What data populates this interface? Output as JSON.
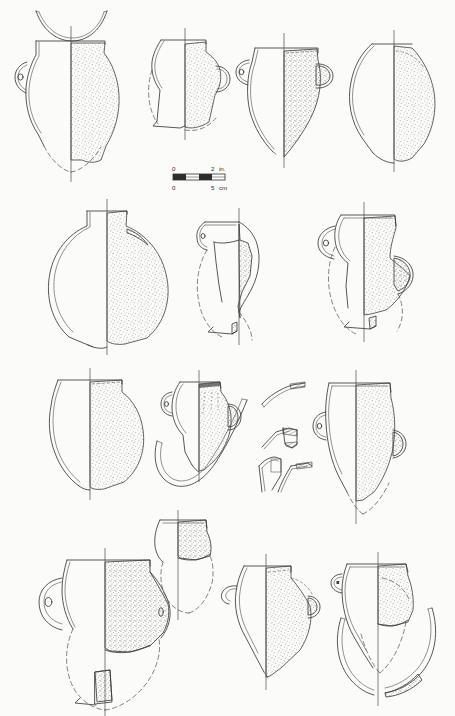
{
  "plate": {
    "title": "Ceramic vessel profile plate",
    "description": "Archaeological illustration plate of fourteen reconstructed ceramic vessel profiles with loose rim and handle sherds and a dual-unit scale bar.",
    "background_color": "#fbfbfa",
    "ink_color": "#3a3a3a",
    "stipple_color": "#6e6e6e",
    "rows": 4
  },
  "scale_bar": {
    "name": "scale-bar",
    "imperial": {
      "start_label": "0",
      "end_label": "2",
      "unit_label": "in.",
      "max": 2
    },
    "metric": {
      "start_label": "0",
      "end_label": "5",
      "unit_label": "cm",
      "max": 5
    },
    "segments": 4,
    "bar_length_px": 52
  },
  "vessels": [
    {
      "id": "v1",
      "name": "globular-jar-pierced-lug",
      "row": 1,
      "form": "globular jar with pierced lug handle",
      "completeness": "upper body preserved, base reconstructed",
      "has_lug_handle": true,
      "lug_pierced": true,
      "has_reconstruction": true,
      "section_side": "right"
    },
    {
      "id": "v1b",
      "name": "shallow-bowl-lid-profile",
      "row": 1,
      "form": "shallow bowl or lid profile",
      "completeness": "full profile",
      "has_lug_handle": false,
      "lug_pierced": false,
      "has_reconstruction": false,
      "section_side": "none"
    },
    {
      "id": "v2",
      "name": "small-jar-flaring-rim",
      "row": 1,
      "form": "small jar with flaring rim and shoulder knob",
      "completeness": "rim and shoulder preserved",
      "has_lug_handle": false,
      "lug_pierced": false,
      "has_reconstruction": true,
      "section_side": "right"
    },
    {
      "id": "v3",
      "name": "ovoid-jar-lug-handle",
      "row": 1,
      "form": "ovoid jar with pierced lug and shoulder boss",
      "completeness": "near complete profile",
      "has_lug_handle": true,
      "lug_pierced": true,
      "has_reconstruction": true,
      "section_side": "right"
    },
    {
      "id": "v4",
      "name": "ovoid-jar-narrow-neck",
      "row": 1,
      "form": "ovoid jar with narrow neck",
      "completeness": "near complete profile",
      "has_lug_handle": false,
      "lug_pierced": false,
      "has_reconstruction": false,
      "section_side": "right"
    },
    {
      "id": "v5",
      "name": "globular-jar-short-neck",
      "row": 2,
      "form": "large globular jar with short collar neck",
      "completeness": "complete profile",
      "has_lug_handle": false,
      "lug_pierced": false,
      "has_reconstruction": false,
      "section_side": "right"
    },
    {
      "id": "v6",
      "name": "jar-body-sherd-reconstructed",
      "row": 2,
      "form": "jar with pierced lug, body sherds only",
      "completeness": "fragmentary, profile reconstructed",
      "has_lug_handle": true,
      "lug_pierced": true,
      "has_reconstruction": true,
      "section_side": "right"
    },
    {
      "id": "v7",
      "name": "jar-everted-rim-lug",
      "row": 2,
      "form": "jar with everted rim and pierced lug handle",
      "completeness": "upper body preserved, base reconstructed",
      "has_lug_handle": true,
      "lug_pierced": true,
      "has_reconstruction": true,
      "section_side": "right"
    },
    {
      "id": "v8",
      "name": "globular-jar-wide-mouth",
      "row": 3,
      "form": "wide-mouthed globular jar",
      "completeness": "complete profile",
      "has_lug_handle": false,
      "lug_pierced": false,
      "has_reconstruction": false,
      "section_side": "right"
    },
    {
      "id": "v9",
      "name": "small-jar-pierced-lug",
      "row": 3,
      "form": "small jar with pierced lug handle",
      "completeness": "near complete profile",
      "has_lug_handle": true,
      "lug_pierced": true,
      "has_reconstruction": false,
      "section_side": "right"
    },
    {
      "id": "v10",
      "name": "ovoid-jar-tall-body",
      "row": 3,
      "form": "tall ovoid jar with pierced lug",
      "completeness": "upper body preserved, base reconstructed",
      "has_lug_handle": true,
      "lug_pierced": true,
      "has_reconstruction": true,
      "section_side": "right"
    },
    {
      "id": "v11",
      "name": "large-jar-lug-handle",
      "row": 4,
      "form": "large jar with prominent pierced lug handle",
      "completeness": "body sherds preserved, base reconstructed",
      "has_lug_handle": true,
      "lug_pierced": true,
      "has_reconstruction": true,
      "section_side": "right"
    },
    {
      "id": "v12",
      "name": "jar-rim-fragment-small",
      "row": 4,
      "form": "small jar rim and shoulder fragment",
      "completeness": "fragmentary, profile reconstructed",
      "has_lug_handle": false,
      "lug_pierced": false,
      "has_reconstruction": true,
      "section_side": "right"
    },
    {
      "id": "v13",
      "name": "carinated-jar-shoulder",
      "row": 4,
      "form": "carinated jar with angular shoulder",
      "completeness": "near complete profile",
      "has_lug_handle": true,
      "lug_pierced": false,
      "has_reconstruction": true,
      "section_side": "right"
    },
    {
      "id": "v14",
      "name": "ovoid-jar-detached-handle",
      "row": 4,
      "form": "ovoid jar with detached strap handle",
      "completeness": "upper body preserved, lower body reconstructed",
      "has_lug_handle": true,
      "lug_pierced": false,
      "has_reconstruction": true,
      "section_side": "right"
    }
  ],
  "sherds": [
    {
      "id": "s1",
      "name": "strap-handle-sherd-upper",
      "form": "curved strap handle fragment",
      "break_hatched": true
    },
    {
      "id": "s2",
      "name": "rim-sherd-hatched",
      "form": "small rim sherd with hatched break edge",
      "break_hatched": true
    },
    {
      "id": "s3",
      "name": "handle-attachment-sherd-left",
      "form": "handle attachment fragment",
      "break_hatched": true
    },
    {
      "id": "s4",
      "name": "handle-attachment-sherd-right",
      "form": "handle attachment fragment with rim",
      "break_hatched": true
    },
    {
      "id": "s5",
      "name": "detached-handle-arc-row3",
      "form": "long detached handle arc",
      "break_hatched": false
    }
  ]
}
